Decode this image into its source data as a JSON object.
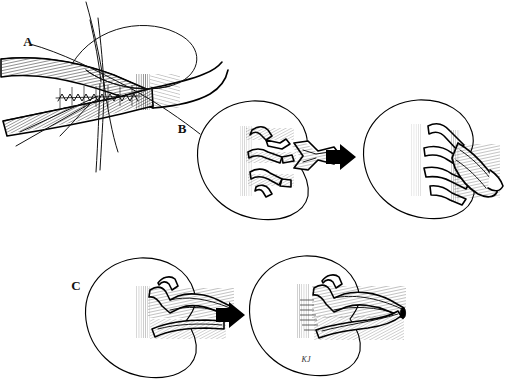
{
  "figure": {
    "background_color": "#ffffff",
    "ink_color": "#000000",
    "width": 505,
    "height": 384,
    "style": "pen-and-ink medical line illustration"
  },
  "panels": [
    {
      "id": "A",
      "label": "A",
      "label_x": 28,
      "label_y": 46,
      "caption": "End-to-side vascular anastomosis with running suture and stay sutures",
      "elements": [
        "upper-vessel-limb",
        "lower-vessel-limb",
        "running-suture-line",
        "suture-loop",
        "suture-tails"
      ]
    },
    {
      "id": "B",
      "label": "B",
      "label_x": 182,
      "label_y": 133,
      "caption": "Multiple renal arteries joined to a Y-shaped branched arterial graft",
      "elements": [
        "donor-kidney-multiple-arteries",
        "branched-Y-graft",
        "transition-arrow",
        "reconstructed-kidney-conduit"
      ]
    },
    {
      "id": "C",
      "label": "C",
      "label_x": 76,
      "label_y": 290,
      "caption": "Lower-pole accessory artery anastomosed end-to-side to the main renal artery",
      "elements": [
        "kidney-main-artery-and-free-polar-artery",
        "transition-arrow",
        "kidney-with-completed-anastomosis",
        "artist-signature"
      ]
    }
  ],
  "labels": {
    "panel_a": "A",
    "panel_b": "B",
    "panel_c": "C",
    "signature": "KJ"
  },
  "arrows": [
    {
      "name": "arrow-panel-b",
      "x": 330,
      "y": 157,
      "direction": "right"
    },
    {
      "name": "arrow-panel-c",
      "x": 220,
      "y": 314,
      "direction": "right"
    }
  ],
  "colors": {
    "ink": "#000000",
    "paper": "#ffffff",
    "hatch": "#1a1a1a",
    "label": "#111111"
  }
}
